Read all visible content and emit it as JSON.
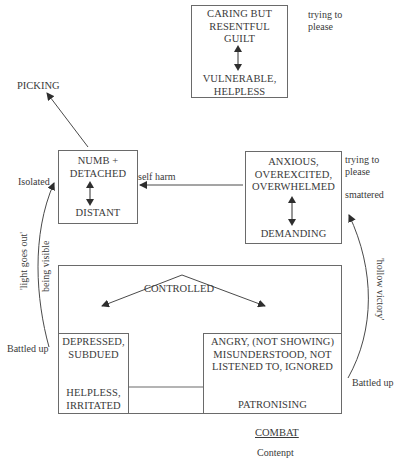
{
  "diagram": {
    "nodes": {
      "caring": {
        "top_lines": [
          "CARING BUT",
          "RESENTFUL",
          "GUILT"
        ],
        "bottom_lines": [
          "VULNERABLE,",
          "HELPLESS"
        ],
        "side_note": [
          "trying to",
          "please"
        ]
      },
      "picking": {
        "label": "PICKING"
      },
      "numb": {
        "top_lines": [
          "NUMB +",
          "DETACHED"
        ],
        "bottom_lines": [
          "DISTANT"
        ],
        "left_note": "Isolated",
        "right_note": "self harm"
      },
      "anxious": {
        "top_lines": [
          "ANXIOUS,",
          "OVEREXCITED,",
          "OVERWHELMED"
        ],
        "bottom_lines": [
          "DEMANDING"
        ],
        "side_note": [
          "trying to",
          "please"
        ],
        "side_note_2": "smattered"
      },
      "controlled": {
        "label": "CONTROLLED"
      },
      "depressed": {
        "top_lines": [
          "DEPRESSED,",
          "SUBDUED"
        ],
        "bottom_lines": [
          "HELPLESS,",
          "IRRITATED"
        ]
      },
      "angry": {
        "top_lines": [
          "ANGRY, (NOT SHOWING)",
          "MISUNDERSTOOD, NOT",
          "LISTENED TO, IGNORED"
        ],
        "bottom_lines": [
          "PATRONISING"
        ]
      }
    },
    "annotations": {
      "left_curve_outer": "'light goes out'",
      "left_curve_inner": "being visible",
      "left_battled": "Battled up",
      "right_curve": "'hollow victory'",
      "right_battled": "Battled up",
      "combat": "COMBAT",
      "contempt": "Contenpt"
    },
    "colors": {
      "line": "#4a4a4a",
      "box_border": "#6a6a6a",
      "text": "#3a3a3a",
      "background": "#ffffff"
    }
  }
}
